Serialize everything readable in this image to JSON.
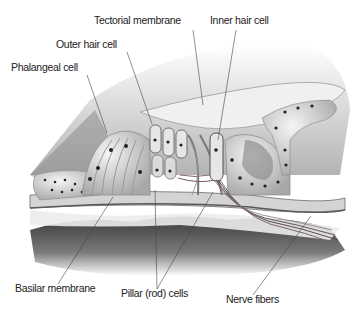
{
  "diagram": {
    "labels": [
      {
        "id": "tectorial",
        "text": "Tectorial membrane",
        "x": 94,
        "y": 20
      },
      {
        "id": "inner-hair",
        "text": "Inner hair cell",
        "x": 210,
        "y": 20
      },
      {
        "id": "outer-hair",
        "text": "Outer hair cell",
        "x": 56,
        "y": 43
      },
      {
        "id": "phalangeal",
        "text": "Phalangeal cell",
        "x": 11,
        "y": 66
      },
      {
        "id": "basilar",
        "text": "Basilar membrane",
        "x": 15,
        "y": 287
      },
      {
        "id": "pillar",
        "text": "Pillar (rod) cells",
        "x": 121,
        "y": 292
      },
      {
        "id": "nerve",
        "text": "Nerve fibers",
        "x": 226,
        "y": 298
      }
    ],
    "colors": {
      "label_text": "#222222",
      "leader_line": "#444444",
      "background": "#ffffff"
    }
  }
}
